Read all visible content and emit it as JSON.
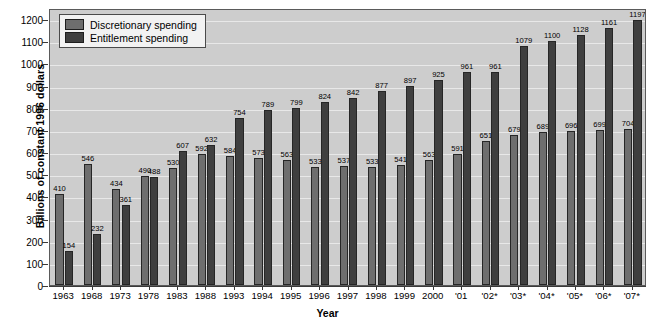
{
  "chart_data": {
    "type": "bar",
    "title": "",
    "xlabel": "Year",
    "ylabel": "Billions of constant 1996 dollars",
    "ylim": [
      0,
      1250
    ],
    "yticks": [
      0,
      100,
      200,
      300,
      400,
      500,
      600,
      700,
      800,
      900,
      1000,
      1100,
      1200
    ],
    "grid": true,
    "legend_position": "top-left",
    "categories": [
      "1963",
      "1968",
      "1973",
      "1978",
      "1983",
      "1988",
      "1993",
      "1994",
      "1995",
      "1996",
      "1997",
      "1998",
      "1999",
      "2000",
      "'01",
      "'02*",
      "'03*",
      "'04*",
      "'05*",
      "'06*",
      "'07*"
    ],
    "series": [
      {
        "name": "Discretionary spending",
        "color": "#6e6e6e",
        "values": [
          410,
          546,
          434,
          490,
          530,
          592,
          584,
          573,
          563,
          533,
          537,
          533,
          541,
          563,
          591,
          651,
          679,
          689,
          696,
          699,
          704
        ]
      },
      {
        "name": "Entitlement spending",
        "color": "#3f3f3f",
        "values": [
          154,
          232,
          361,
          488,
          607,
          632,
          754,
          789,
          799,
          824,
          842,
          877,
          897,
          925,
          961,
          961,
          1079,
          1100,
          1128,
          1161,
          1197
        ]
      }
    ]
  },
  "legend": {
    "items": [
      {
        "label": "Discretionary spending",
        "key": "disc"
      },
      {
        "label": "Entitlement spending",
        "key": "ent"
      }
    ]
  },
  "axes": {
    "y_title": "Billions of constant 1996 dollars",
    "x_title": "Year"
  },
  "colors": {
    "plot_background": "#cdcdcd",
    "gridline": "#e8e8e8",
    "discretionary": "#6e6e6e",
    "entitlement": "#3f3f3f",
    "axis": "#3a3a3a"
  }
}
